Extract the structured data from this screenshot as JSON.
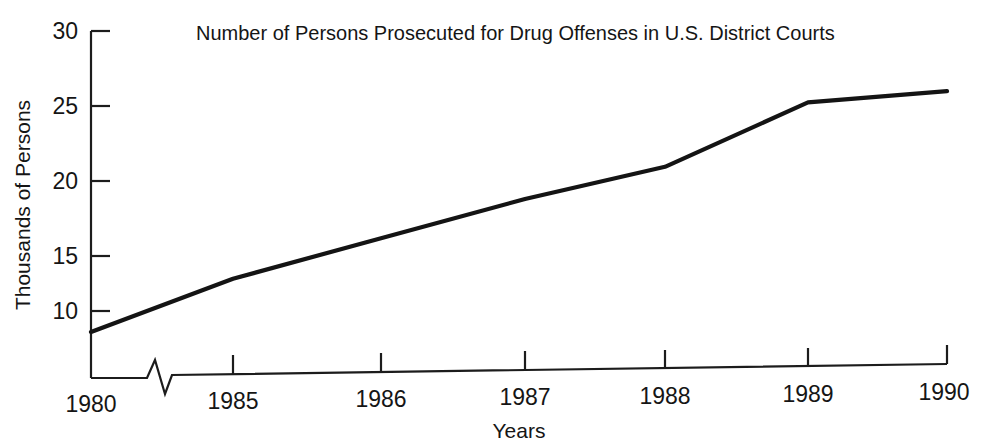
{
  "chart_data": {
    "type": "line",
    "title": "Number of Persons Prosecuted for Drug Offenses in U.S. District Courts",
    "xlabel": "Years",
    "ylabel": "Thousands of Persons",
    "x": [
      "1980",
      "1985",
      "1986",
      "1987",
      "1988",
      "1989",
      "1990"
    ],
    "categories": [
      "1980",
      "1985",
      "1986",
      "1987",
      "1988",
      "1989",
      "1990"
    ],
    "series": [
      {
        "name": "Persons prosecuted for drug offenses",
        "values": [
          8.5,
          12.3,
          15.2,
          18.0,
          20.3,
          24.9,
          25.7
        ]
      }
    ],
    "values": [
      8.5,
      12.3,
      15.2,
      18.0,
      20.3,
      24.9,
      25.7
    ],
    "ytick_labels": [
      "10",
      "15",
      "20",
      "25",
      "30"
    ],
    "ytick_values": [
      10,
      15,
      20,
      25,
      30
    ],
    "xtick_labels": [
      "1980",
      "1985",
      "1986",
      "1987",
      "1988",
      "1989",
      "1990"
    ],
    "ylim": [
      6.5,
      30
    ],
    "grid": false,
    "legend": "none",
    "axis_break": {
      "axis": "x",
      "label": "zigzag-break-between-1980-and-1985",
      "present": true
    },
    "line_color": "#141414",
    "axis_color": "#1c1c1c",
    "background_color": "#ffffff"
  },
  "labels": {
    "title": "Number of Persons Prosecuted for Drug Offenses in U.S. District Courts",
    "y_axis_title": "Thousands of Persons",
    "x_axis_title": "Years",
    "y_30": "30",
    "y_25": "25",
    "y_20": "20",
    "y_15": "15",
    "y_10": "10",
    "x_1980": "1980",
    "x_1985": "1985",
    "x_1986": "1986",
    "x_1987": "1987",
    "x_1988": "1988",
    "x_1989": "1989",
    "x_1990": "1990"
  }
}
